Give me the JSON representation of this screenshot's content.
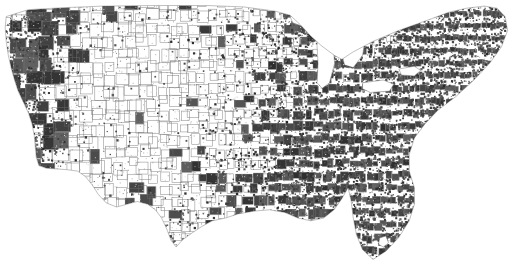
{
  "figure": {
    "kind": "choropleth-map",
    "title": "",
    "subtitle": "",
    "caption": "",
    "region": "Contiguous United States",
    "unit_of_analysis": "county",
    "background_color": "#ffffff",
    "border_color": "#8a8a8a",
    "fill_low_color": "#ffffff",
    "fill_high_color": "#3f3f3f",
    "width_px": 518,
    "height_px": 276,
    "has_legend": false,
    "has_axes": false,
    "has_title_text": false,
    "has_graticule": false
  },
  "chart_data": {
    "type": "heatmap",
    "title": "",
    "xlabel": "",
    "ylabel": "",
    "projection": "albers-usa-like",
    "grid": false,
    "legend_position": "none",
    "value_scale": {
      "low_label": "",
      "high_label": "",
      "low_color": "#ffffff",
      "high_color": "#3f3f3f"
    },
    "lon_range": [
      -125.0,
      -66.9
    ],
    "lat_range": [
      24.4,
      49.4
    ],
    "description": "County-level binary/graded shading of the contiguous United States. Shaded (dark) counties form a near-continuous mass across the eastern third of the country - densest in the Southeast, Appalachia, the Mid-Atlantic and New England, and all of peninsular Florida. Coverage thins through the Great Plains into a sparse scatter of isolated dark counties across the Mountain West, with a dense dark cluster along the Pacific coast of California and the Pacific Northwest. Great Lakes appear as unfilled white voids.",
    "regions": [
      {
        "name": "Pacific Northwest",
        "coverage": 0.72,
        "note": "dense small dark counties near coast"
      },
      {
        "name": "California coast",
        "coverage": 0.8,
        "note": "continuous dark coastal band"
      },
      {
        "name": "California interior",
        "coverage": 0.35,
        "note": "mixed, large counties"
      },
      {
        "name": "Great Basin / Nevada",
        "coverage": 0.3,
        "note": "few very large dark counties"
      },
      {
        "name": "Mountain West",
        "coverage": 0.25,
        "note": "isolated dark county blocks"
      },
      {
        "name": "Northern Plains",
        "coverage": 0.2,
        "note": "sparse scatter on fine county grid"
      },
      {
        "name": "Central Plains",
        "coverage": 0.28,
        "note": "fine grid, scattered dark cells"
      },
      {
        "name": "Texas",
        "coverage": 0.33,
        "note": "white west, darker east"
      },
      {
        "name": "Upper Midwest",
        "coverage": 0.55,
        "note": "one solid dark blob near Lake Superior"
      },
      {
        "name": "Ohio Valley / Appalachia",
        "coverage": 0.88,
        "note": "near-continuous dark"
      },
      {
        "name": "Southeast",
        "coverage": 0.93,
        "note": "densest shading in map"
      },
      {
        "name": "Florida peninsula",
        "coverage": 0.97,
        "note": "solid dark, white notch at Lake Okeechobee"
      },
      {
        "name": "Mid-Atlantic",
        "coverage": 0.9,
        "note": "continuous dark"
      },
      {
        "name": "New England",
        "coverage": 0.85,
        "note": "dark with lighter interior pockets"
      }
    ],
    "water_bodies": [
      {
        "name": "Lake Superior",
        "fill": "#ffffff"
      },
      {
        "name": "Lake Michigan",
        "fill": "#ffffff"
      },
      {
        "name": "Lake Huron",
        "fill": "#ffffff"
      },
      {
        "name": "Lake Erie",
        "fill": "#ffffff"
      },
      {
        "name": "Lake Ontario",
        "fill": "#ffffff"
      },
      {
        "name": "Lake Okeechobee",
        "fill": "#ffffff"
      }
    ]
  }
}
